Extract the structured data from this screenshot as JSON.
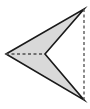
{
  "figure": {
    "title": "Concave arrowhead (dart) polygon with dashed construction lines",
    "shape_name": "arrowhead-polygon",
    "canvas": {
      "width": 90,
      "height": 109,
      "background": "#ffffff"
    },
    "colors": {
      "fill": "#d9d9d9",
      "stroke": "#1a1a1a",
      "dashed_stroke": "#4d4d4d",
      "background": "#ffffff"
    },
    "stroke_width": 1.6,
    "dashed_stroke_width": 1.3,
    "dash_pattern": "3,2.5",
    "vertices": [
      {
        "name": "left-point",
        "label": "A",
        "x": 6,
        "y": 54
      },
      {
        "name": "top-right-point",
        "label": "B",
        "x": 84,
        "y": 9
      },
      {
        "name": "notch-point",
        "label": "C",
        "x": 45,
        "y": 54
      },
      {
        "name": "bottom-right-point",
        "label": "D",
        "x": 84,
        "y": 100
      }
    ],
    "polygon_points": "6,54 84,9 45,54 84,100",
    "construction_lines": [
      {
        "name": "horizontal-axis-line",
        "style": "dashed",
        "x1": 6,
        "y1": 54,
        "x2": 45,
        "y2": 54
      },
      {
        "name": "vertical-chord-line",
        "style": "dashed",
        "x1": 84,
        "y1": 9,
        "x2": 84,
        "y2": 100
      }
    ],
    "sub_triangles": [
      {
        "name": "upper-triangle",
        "points": "6,54 84,9 45,54"
      },
      {
        "name": "lower-triangle",
        "points": "6,54 45,54 84,100"
      }
    ]
  }
}
